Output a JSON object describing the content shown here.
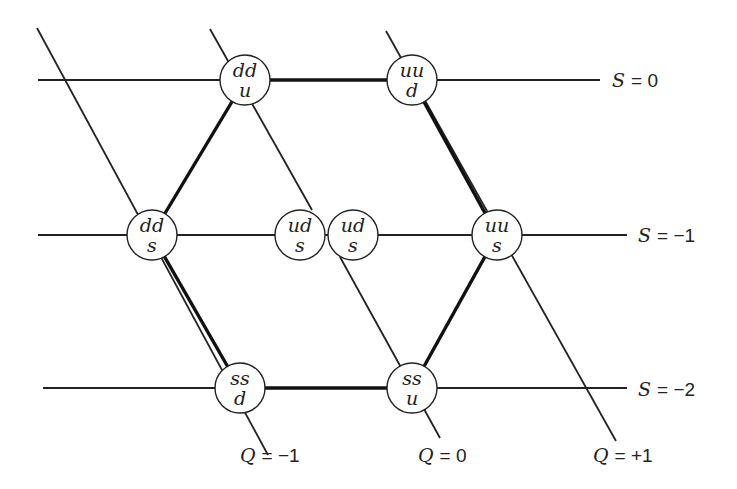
{
  "diagram": {
    "colors": {
      "line": "#222222",
      "circle_fill": "#ffffff",
      "background": "#ffffff"
    },
    "strangeness_lines": [
      {
        "label": "S = 0",
        "var": "S",
        "value": "= 0",
        "y": 80,
        "x1": 38,
        "x2": 600,
        "label_x": 612
      },
      {
        "label": "S = −1",
        "var": "S",
        "value": "= −1",
        "y": 235,
        "x1": 38,
        "x2": 627,
        "label_x": 638
      },
      {
        "label": "S = −2",
        "var": "S",
        "value": "= −2",
        "y": 388,
        "x1": 43,
        "x2": 627,
        "label_x": 638
      }
    ],
    "charge_lines": [
      {
        "label": "Q = −1",
        "var": "Q",
        "value": "= −1",
        "label_x": 240,
        "label_y": 462
      },
      {
        "label": "Q = 0",
        "var": "Q",
        "value": "= 0",
        "label_x": 418,
        "label_y": 462
      },
      {
        "label": "Q = +1",
        "var": "Q",
        "value": "= +1",
        "label_x": 592,
        "label_y": 462
      }
    ],
    "particles": [
      {
        "id": "ddu",
        "top": "dd",
        "bottom": "u",
        "cx": 245,
        "cy": 80
      },
      {
        "id": "uud",
        "top": "uu",
        "bottom": "d",
        "cx": 412,
        "cy": 80
      },
      {
        "id": "dds",
        "top": "dd",
        "bottom": "s",
        "cx": 152,
        "cy": 235
      },
      {
        "id": "uds1",
        "top": "ud",
        "bottom": "s",
        "cx": 300,
        "cy": 235
      },
      {
        "id": "uds2",
        "top": "ud",
        "bottom": "s",
        "cx": 353,
        "cy": 235
      },
      {
        "id": "uus",
        "top": "uu",
        "bottom": "s",
        "cx": 497,
        "cy": 235
      },
      {
        "id": "ssd",
        "top": "ss",
        "bottom": "d",
        "cx": 240,
        "cy": 388
      },
      {
        "id": "ssu",
        "top": "ss",
        "bottom": "u",
        "cx": 412,
        "cy": 388
      }
    ],
    "labels": {
      "s0": "S = 0",
      "s1": "S = −1",
      "s2": "S = −2",
      "q_1": "Q = −1",
      "q0": "Q = 0",
      "q1": "Q = +1"
    }
  }
}
